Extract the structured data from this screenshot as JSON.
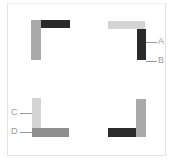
{
  "colors": {
    "dark": "#2a2a2a",
    "medium": "#8f8f8f",
    "gray": "#a9a9a9",
    "light": "#d4d4d4",
    "label": "#9a9a9a",
    "frame": "#e4e4e4"
  },
  "quadrants": {
    "top_left": {
      "vertical_bar": "gray",
      "horizontal_bar": "dark"
    },
    "top_right": {
      "horizontal_bar": "light",
      "vertical_bar": "dark",
      "labels": [
        "A",
        "B"
      ]
    },
    "bottom_left": {
      "vertical_bar": "light",
      "horizontal_bar": "medium",
      "labels": [
        "C",
        "D"
      ]
    },
    "bottom_right": {
      "vertical_bar": "gray",
      "horizontal_bar": "dark"
    }
  }
}
